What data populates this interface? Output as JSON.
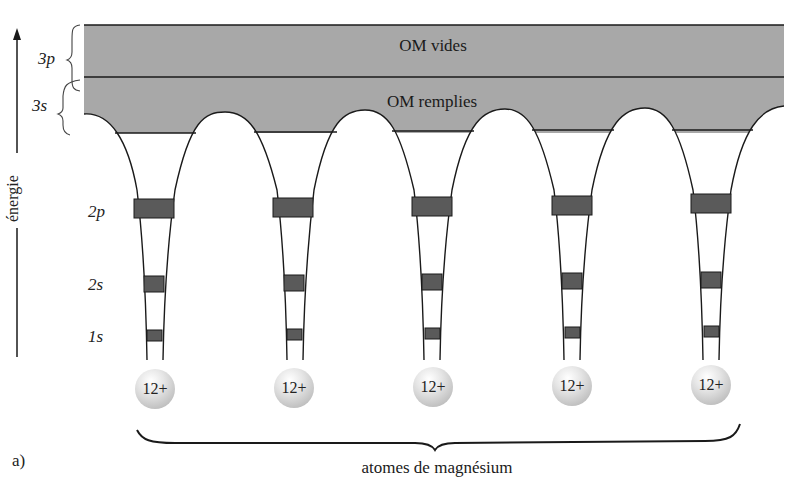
{
  "figure": {
    "panel_label": "a)",
    "axis_label": "énergie",
    "bands": {
      "upper": {
        "orbital": "3p",
        "label": "OM vides"
      },
      "lower": {
        "orbital": "3s",
        "label": "OM remplies"
      }
    },
    "levels": [
      {
        "orbital": "2p"
      },
      {
        "orbital": "2s"
      },
      {
        "orbital": "1s"
      }
    ],
    "atoms": [
      {
        "charge": "12+"
      },
      {
        "charge": "12+"
      },
      {
        "charge": "12+"
      },
      {
        "charge": "12+"
      },
      {
        "charge": "12+"
      }
    ],
    "brace_label": "atomes de magnésium",
    "colors": {
      "band_fill": "#a8a8a8",
      "level_fill": "#5a5a5a",
      "line": "#1a1a1a"
    }
  }
}
